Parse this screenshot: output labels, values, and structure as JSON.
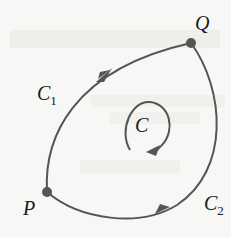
{
  "diagram": {
    "points": {
      "P": {
        "label": "P",
        "x": 47,
        "y": 192
      },
      "Q": {
        "label": "Q",
        "x": 191,
        "y": 43
      }
    },
    "curves": [
      {
        "name": "C",
        "sub": "1",
        "label": "C",
        "direction": "P to Q (upper-left arc)"
      },
      {
        "name": "C",
        "sub": "2",
        "label": "C",
        "direction": "P to Q (lower-right arc)"
      }
    ],
    "closed_curve": {
      "label": "C",
      "orientation": "clockwise"
    },
    "colors": {
      "curve": "#555555",
      "point": "#555555",
      "text": "#1a1a1a",
      "background": "#f7f7f5"
    }
  }
}
